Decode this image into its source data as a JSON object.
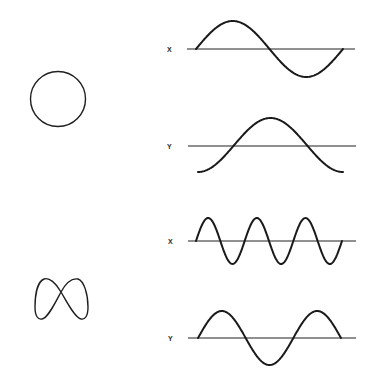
{
  "figure": {
    "panels": [
      {
        "name": "circle",
        "lissajous_shape": "circle",
        "frequency_ratio_xy": "1:1",
        "phase_difference": "90 deg",
        "x_label": "X",
        "y_label": "Y",
        "x_wave": {
          "cycles": 1,
          "form": "sine"
        },
        "y_wave": {
          "cycles": 1,
          "form": "-cosine"
        }
      },
      {
        "name": "figure-eight",
        "lissajous_shape": "figure-eight",
        "frequency_ratio_xy": "2:1",
        "x_label": "X",
        "y_label": "Y",
        "x_wave": {
          "cycles": 3,
          "form": "sine"
        },
        "y_wave": {
          "cycles": 1.5,
          "form": "sine"
        }
      }
    ],
    "colors": {
      "stroke": "#1a1a1a",
      "background": "#ffffff"
    }
  }
}
